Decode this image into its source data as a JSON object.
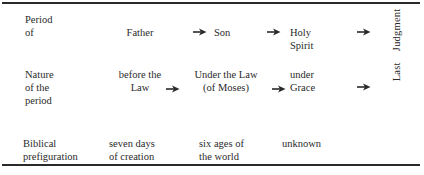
{
  "table": {
    "rows": [
      {
        "label": [
          "Period",
          "of"
        ],
        "cells": [
          [
            "Father"
          ],
          [
            "Son"
          ],
          [
            "Holy",
            "Spirit"
          ]
        ]
      },
      {
        "label": [
          "Nature",
          "of the",
          "period"
        ],
        "cells": [
          [
            "before the",
            "Law"
          ],
          [
            "Under the Law",
            "(of Moses)"
          ],
          [
            "under",
            "Grace"
          ]
        ]
      },
      {
        "label": [
          "Biblical",
          "prefiguration"
        ],
        "cells": [
          [
            "seven days",
            "of creation"
          ],
          [
            "six ages of",
            "the world"
          ],
          [
            "unknown"
          ]
        ]
      }
    ],
    "side_label": "Last    Judgment",
    "arrow_icon": "right-arrow",
    "colors": {
      "ink": "#2a2a2a",
      "paper": "#ffffff"
    }
  }
}
